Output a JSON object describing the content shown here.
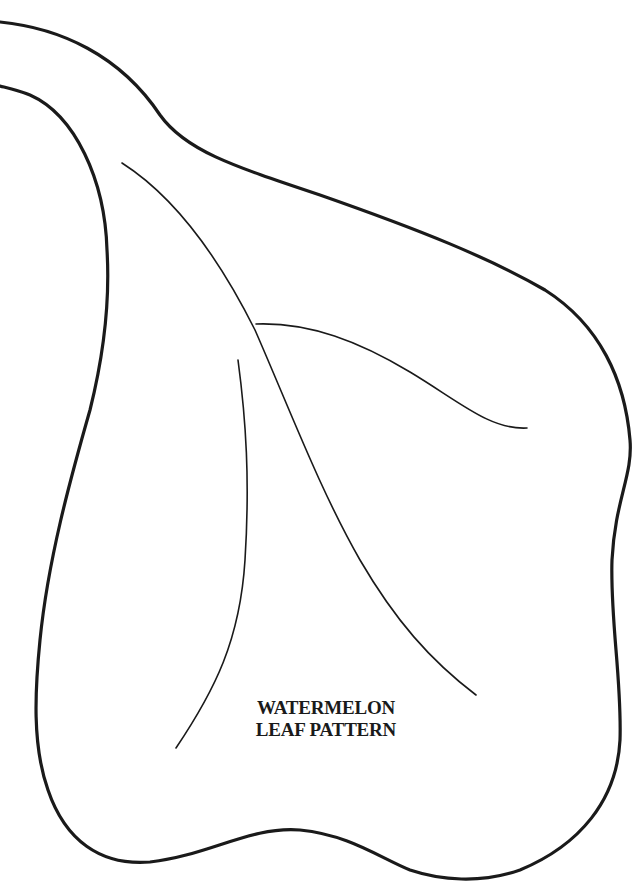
{
  "title": {
    "line1": "WATERMELON",
    "line2": "LEAF PATTERN"
  },
  "colors": {
    "stroke": "#1a1a1a",
    "background": "#ffffff"
  }
}
